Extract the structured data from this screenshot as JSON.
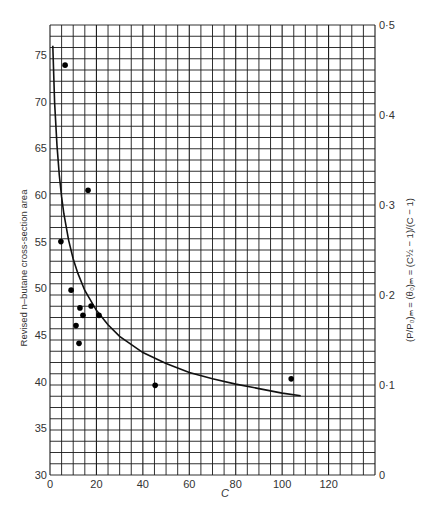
{
  "chart_data": {
    "type": "scatter",
    "title": "",
    "xlabel": "C",
    "ylabel": "Revised n-butane cross-section area",
    "ylabel_right": "(P/P0)m = (θ0)m = (C^½ − 1)/(C − 1)",
    "xlim": [
      0,
      140
    ],
    "ylim": [
      30,
      78.2
    ],
    "ylim_right": [
      0,
      0.5
    ],
    "grid": true,
    "x_ticks": [
      "0",
      "20",
      "40",
      "60",
      "80",
      "100",
      "120"
    ],
    "x_tick_values": [
      0,
      20,
      40,
      60,
      80,
      100,
      120
    ],
    "y_ticks": [
      "30",
      "35",
      "40",
      "45",
      "50",
      "55",
      "60",
      "65",
      "70",
      "75"
    ],
    "y_tick_values": [
      30,
      35,
      40,
      45,
      50,
      55,
      60,
      65,
      70,
      75
    ],
    "y_right_ticks": [
      "0",
      "0·1",
      "0·2",
      "0·3",
      "0·4",
      "0·5"
    ],
    "y_right_tick_values": [
      0,
      0.1,
      0.2,
      0.3,
      0.4,
      0.5
    ],
    "series": [
      {
        "name": "data points",
        "kind": "scatter",
        "x": [
          6.5,
          4.7,
          9.1,
          12.9,
          17.7,
          14.2,
          21.1,
          11.2,
          12.5,
          16.4,
          45.3,
          103.9
        ],
        "y": [
          73.9,
          55.0,
          49.8,
          47.9,
          48.1,
          47.1,
          47.1,
          46.0,
          44.1,
          60.5,
          39.6,
          40.3
        ]
      },
      {
        "name": "(P/P0)m curve (right axis)",
        "kind": "line",
        "axis": "right",
        "x": [
          1.2,
          2,
          3,
          4,
          5,
          6,
          8,
          10,
          12,
          15,
          20,
          25,
          30,
          40,
          50,
          60,
          70,
          80,
          90,
          100,
          108
        ],
        "y": [
          0.477,
          0.414,
          0.366,
          0.333,
          0.309,
          0.29,
          0.261,
          0.24,
          0.224,
          0.205,
          0.183,
          0.167,
          0.154,
          0.136,
          0.124,
          0.114,
          0.107,
          0.101,
          0.096,
          0.091,
          0.088
        ]
      }
    ]
  },
  "axes": {
    "x_label": "C",
    "y_label": "Revised n–butane cross-section area",
    "y_right_label": "(P/P₀)ₘ = (θ₀)ₘ = (C½ − 1)/(C − 1)"
  }
}
